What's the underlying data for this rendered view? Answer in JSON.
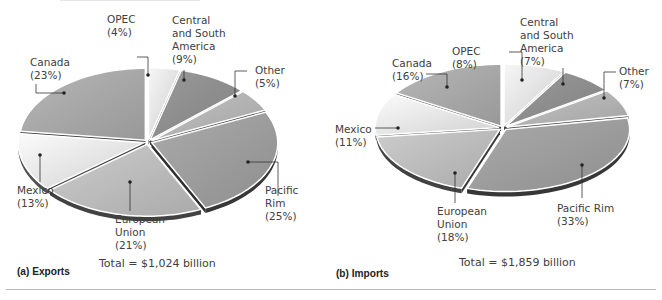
{
  "chart_data": [
    {
      "type": "pie",
      "title": "(a) Exports",
      "total_label": "Total = $1,024 billion",
      "total_value_billion": 1024,
      "unit": "percent of total",
      "categories": [
        "OPEC",
        "Central and South America",
        "Other",
        "Pacific Rim",
        "European Union",
        "Mexico",
        "Canada"
      ],
      "values": [
        4,
        9,
        5,
        25,
        21,
        13,
        23
      ],
      "labels": [
        "OPEC\n(4%)",
        "Central\nand South\nAmerica\n(9%)",
        "Other\n(5%)",
        "Pacific\nRim\n(25%)",
        "European\nUnion\n(21%)",
        "Mexico\n(13%)",
        "Canada\n(23%)"
      ],
      "colors": [
        "#e4e4e4",
        "#8f8f8f",
        "#b5b5b5",
        "#9e9e9e",
        "#bdbdbd",
        "#e8e8e8",
        "#a9a9a9"
      ],
      "style": "3D exploded pie, grayscale"
    },
    {
      "type": "pie",
      "title": "(b) Imports",
      "total_label": "Total = $1,859 billion",
      "total_value_billion": 1859,
      "unit": "percent of total",
      "categories": [
        "OPEC",
        "Central and South America",
        "Other",
        "Pacific Rim",
        "European Union",
        "Mexico",
        "Canada"
      ],
      "values": [
        8,
        7,
        7,
        33,
        18,
        11,
        16
      ],
      "labels": [
        "OPEC\n(8%)",
        "Central\nand South\nAmerica\n(7%)",
        "Other\n(7%)",
        "Pacific Rim\n(33%)",
        "European\nUnion\n(18%)",
        "Mexico\n(11%)",
        "Canada\n(16%)"
      ],
      "colors": [
        "#e4e4e4",
        "#8f8f8f",
        "#b5b5b5",
        "#9e9e9e",
        "#bdbdbd",
        "#e8e8e8",
        "#a9a9a9"
      ],
      "style": "3D exploded pie, grayscale"
    }
  ],
  "panels": {
    "a": {
      "caption": "(a)  Exports",
      "total": "Total = $1,024 billion",
      "labels": {
        "opec": "OPEC\n(4%)",
        "csa": "Central\nand South\nAmerica\n(9%)",
        "other": "Other\n(5%)",
        "pacific": "Pacific\nRim\n(25%)",
        "eu": "European\nUnion\n(21%)",
        "mexico": "Mexico\n(13%)",
        "canada": "Canada\n(23%)"
      }
    },
    "b": {
      "caption": "(b)  Imports",
      "total": "Total = $1,859 billion",
      "labels": {
        "opec": "OPEC\n(8%)",
        "csa": "Central\nand South\nAmerica\n(7%)",
        "other": "Other\n(7%)",
        "pacific": "Pacific Rim\n(33%)",
        "eu": "European\nUnion\n(18%)",
        "mexico": "Mexico\n(11%)",
        "canada": "Canada\n(16%)"
      }
    }
  }
}
